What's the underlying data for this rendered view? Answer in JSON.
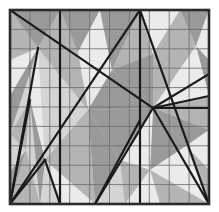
{
  "figure": {
    "type": "geometric-diagram"
  },
  "canvas": {
    "width": 219,
    "height": 212,
    "background": "#ffffff"
  },
  "domain": {
    "name": "unit-square",
    "x0": 10,
    "y0": 10,
    "x1": 209,
    "y1": 204,
    "border_color": "#2b2b2b",
    "border_width": 2.6
  },
  "grid": {
    "columns": 10,
    "rows": 10,
    "line_color": "#6e6e6e",
    "line_width": 0.85,
    "visible": true
  },
  "palette": {
    "light": "#ebebeb",
    "mid_light": "#d4d4d4",
    "mid": "#b4b4b4",
    "dark": "#9a9a9a",
    "darker": "#8c8c8c",
    "line": "#1a1a1a",
    "grid": "#6e6e6e"
  },
  "shaded_regions": [
    {
      "id": "r01",
      "tone": "dark",
      "points": "10,10 60,10 38,48"
    },
    {
      "id": "r02",
      "tone": "mid",
      "points": "10,10 10,60 38,48"
    },
    {
      "id": "r03",
      "tone": "light",
      "points": "38,48 10,60 10,96"
    },
    {
      "id": "r04",
      "tone": "dark",
      "points": "10,96 10,134 38,48"
    },
    {
      "id": "r05",
      "tone": "mid_light",
      "points": "10,134 10,172 30,100"
    },
    {
      "id": "r06",
      "tone": "dark",
      "points": "10,172 10,204 26,150"
    },
    {
      "id": "r07",
      "tone": "mid",
      "points": "26,150 10,204 40,204"
    },
    {
      "id": "r08",
      "tone": "light",
      "points": "38,48 30,100 45,160"
    },
    {
      "id": "r09",
      "tone": "dark",
      "points": "60,10 100,10 78,52"
    },
    {
      "id": "r10",
      "tone": "mid",
      "points": "38,48 60,10 78,52"
    },
    {
      "id": "r11",
      "tone": "light",
      "points": "78,52 100,10 112,70"
    },
    {
      "id": "r12",
      "tone": "dark",
      "points": "100,10 140,10 112,70"
    },
    {
      "id": "r13",
      "tone": "mid",
      "points": "140,10 112,70 153,54"
    },
    {
      "id": "r14",
      "tone": "light",
      "points": "140,10 180,10 153,54"
    },
    {
      "id": "r15",
      "tone": "dark",
      "points": "180,10 209,10 196,46"
    },
    {
      "id": "r16",
      "tone": "mid",
      "points": "153,54 180,10 196,46"
    },
    {
      "id": "r17",
      "tone": "light",
      "points": "196,46 209,10 209,60"
    },
    {
      "id": "r18",
      "tone": "dark",
      "points": "209,60 196,46 209,96"
    },
    {
      "id": "r19",
      "tone": "mid",
      "points": "153,54 196,46 153,108"
    },
    {
      "id": "r20",
      "tone": "dark",
      "points": "112,70 153,54 153,108"
    },
    {
      "id": "r21",
      "tone": "light",
      "points": "78,52 112,70 88,110"
    },
    {
      "id": "r22",
      "tone": "mid",
      "points": "38,48 78,52 88,110"
    },
    {
      "id": "r23",
      "tone": "dark",
      "points": "88,110 112,70 153,108"
    },
    {
      "id": "r24",
      "tone": "light",
      "points": "153,108 196,46 209,96"
    },
    {
      "id": "r25",
      "tone": "mid",
      "points": "153,108 209,96 209,130"
    },
    {
      "id": "r26",
      "tone": "dark",
      "points": "153,108 209,130 186,146"
    },
    {
      "id": "r27",
      "tone": "light",
      "points": "186,146 209,130 209,170"
    },
    {
      "id": "r28",
      "tone": "mid",
      "points": "186,146 209,170 209,204"
    },
    {
      "id": "r29",
      "tone": "dark",
      "points": "153,108 186,146 150,170"
    },
    {
      "id": "r30",
      "tone": "light",
      "points": "150,170 186,146 209,204"
    },
    {
      "id": "r31",
      "tone": "mid",
      "points": "150,170 209,204 160,204"
    },
    {
      "id": "r32",
      "tone": "dark",
      "points": "88,110 153,108 120,160"
    },
    {
      "id": "r33",
      "tone": "light",
      "points": "120,160 153,108 150,170"
    },
    {
      "id": "r34",
      "tone": "mid",
      "points": "120,160 150,170 125,204"
    },
    {
      "id": "r35",
      "tone": "dark",
      "points": "88,110 120,160 95,204"
    },
    {
      "id": "r36",
      "tone": "mid",
      "points": "45,160 88,110 95,204"
    },
    {
      "id": "r37",
      "tone": "light",
      "points": "45,160 95,204 60,204"
    },
    {
      "id": "r38",
      "tone": "dark",
      "points": "30,100 45,160 40,204"
    },
    {
      "id": "r39",
      "tone": "mid",
      "points": "10,134 30,100 26,150"
    },
    {
      "id": "r40",
      "tone": "light",
      "points": "125,204 150,170 160,204"
    }
  ],
  "triangulation_edges": [
    {
      "id": "e01",
      "name": "top-left-to-center-diagonal",
      "x1": 10,
      "y1": 10,
      "x2": 153,
      "y2": 108
    },
    {
      "id": "e02",
      "name": "left-spike-outer",
      "x1": 38,
      "y1": 48,
      "x2": 10,
      "y2": 204
    },
    {
      "id": "e03",
      "name": "left-spike-inner",
      "x1": 45,
      "y1": 160,
      "x2": 10,
      "y2": 204
    },
    {
      "id": "e04",
      "name": "left-spike-return",
      "x1": 45,
      "y1": 160,
      "x2": 60,
      "y2": 204
    },
    {
      "id": "e05",
      "name": "left-thin-wedge",
      "x1": 30,
      "y1": 100,
      "x2": 10,
      "y2": 204
    },
    {
      "id": "e06",
      "name": "vertical-left-interior",
      "x1": 60,
      "y1": 10,
      "x2": 60,
      "y2": 204
    },
    {
      "id": "e07",
      "name": "long-up-right-diagonal",
      "x1": 10,
      "y1": 204,
      "x2": 140,
      "y2": 10
    },
    {
      "id": "e08",
      "name": "vertical-center-interior",
      "x1": 140,
      "y1": 10,
      "x2": 140,
      "y2": 204
    },
    {
      "id": "e09",
      "name": "center-to-bottom-right",
      "x1": 140,
      "y1": 10,
      "x2": 209,
      "y2": 204
    },
    {
      "id": "e10",
      "name": "center-node-to-right-edge",
      "x1": 153,
      "y1": 108,
      "x2": 209,
      "y2": 96
    },
    {
      "id": "e11",
      "name": "center-node-to-far-right",
      "x1": 153,
      "y1": 108,
      "x2": 209,
      "y2": 74
    },
    {
      "id": "e12",
      "name": "horizontal-right-segment",
      "x1": 153,
      "y1": 108,
      "x2": 209,
      "y2": 108
    },
    {
      "id": "e13",
      "name": "center-to-bottom-left-ray",
      "x1": 153,
      "y1": 108,
      "x2": 95,
      "y2": 204
    },
    {
      "id": "e14",
      "name": "bottom-right-rise",
      "x1": 95,
      "y1": 204,
      "x2": 140,
      "y2": 120
    },
    {
      "id": "e15",
      "name": "right-descend-to-corner",
      "x1": 153,
      "y1": 108,
      "x2": 209,
      "y2": 204
    }
  ]
}
